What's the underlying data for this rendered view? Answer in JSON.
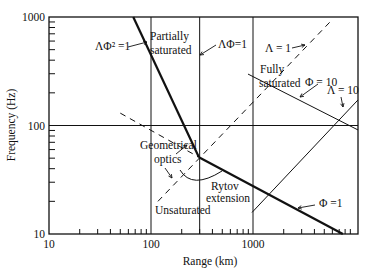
{
  "chart_data": {
    "type": "line",
    "title": "",
    "xlabel": "Range (km)",
    "ylabel": "Frequency (Hz)",
    "xscale": "log",
    "yscale": "log",
    "xlim": [
      10,
      10700
    ],
    "ylim": [
      10,
      1000
    ],
    "xticks": [
      10,
      100,
      1000
    ],
    "xtick_labels": [
      "10",
      "100",
      "1000"
    ],
    "yticks": [
      10,
      100,
      1000
    ],
    "ytick_labels": [
      "10",
      "100",
      "1000"
    ],
    "grid": {
      "x": [
        100,
        300,
        1000
      ],
      "y": [
        100
      ]
    },
    "series": [
      {
        "name": "ΛΦ² = 1",
        "style": "thick",
        "points": [
          [
            67,
            1000
          ],
          [
            295,
            51
          ]
        ]
      },
      {
        "name": "Φ = 1",
        "style": "thick",
        "points": [
          [
            295,
            51
          ],
          [
            7600,
            10
          ]
        ]
      },
      {
        "name": "Λ = 1",
        "style": "dashed",
        "points": [
          [
            117,
            20
          ],
          [
            6060,
            958
          ]
        ]
      },
      {
        "name": "Geometrical optics boundary",
        "style": "dashed",
        "points": [
          [
            50,
            130
          ],
          [
            295,
            51
          ]
        ]
      },
      {
        "name": "Φ = 10",
        "style": "thin",
        "points": [
          [
            893,
            298
          ],
          [
            10700,
            91
          ]
        ]
      },
      {
        "name": "Λ = 10",
        "style": "thin",
        "points": [
          [
            978,
            15.8
          ],
          [
            10700,
            172
          ]
        ]
      }
    ],
    "annotations": [
      {
        "text": "ΛΦ² =1",
        "x": 95,
        "y": 50
      },
      {
        "text": "Partially",
        "x": 150,
        "y": 40
      },
      {
        "text": "saturated",
        "x": 150,
        "y": 54
      },
      {
        "text": "ΛΦ=1",
        "x": 218,
        "y": 48
      },
      {
        "text": "Λ = 1",
        "x": 265,
        "y": 52
      },
      {
        "text": "Fully",
        "x": 260,
        "y": 73
      },
      {
        "text": "saturated",
        "x": 259,
        "y": 87
      },
      {
        "text": "Φ = 10",
        "x": 305,
        "y": 86
      },
      {
        "text": "Λ = 10",
        "x": 327,
        "y": 94
      },
      {
        "text": "Geometrical",
        "x": 140,
        "y": 149
      },
      {
        "text": "optics",
        "x": 154,
        "y": 163
      },
      {
        "text": "Rytov",
        "x": 211,
        "y": 190
      },
      {
        "text": "extension",
        "x": 206,
        "y": 202
      },
      {
        "text": "Unsaturated",
        "x": 155,
        "y": 214
      },
      {
        "text": "Φ =1",
        "x": 319,
        "y": 207
      }
    ]
  }
}
